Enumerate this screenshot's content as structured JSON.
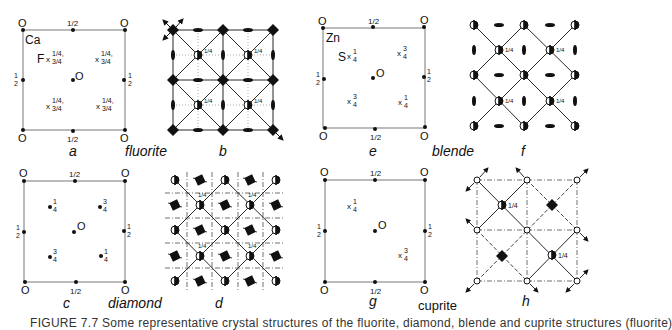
{
  "figure": {
    "caption": "FIGURE 7.7  Some representative crystal structures of the fluorite, diamond, blende and cuprite structures (fluorite)",
    "panels": [
      {
        "id": "a",
        "letter": "a",
        "structure": "fluorite",
        "atom1": "Ca",
        "atom2": "F",
        "corner_label": "O",
        "edge_mid_top": "1/2",
        "edge_mid_bottom": "1/2",
        "side_label": "1/2",
        "center_label": "O",
        "heights": [
          "1/4, 3/4",
          "1/4, 3/4",
          "1/4, 3/4",
          "1/4, 3/4"
        ]
      },
      {
        "id": "b",
        "letter": "b",
        "structure_name": "fluorite",
        "height_label": "1/4"
      },
      {
        "id": "e",
        "letter": "e",
        "structure": "blende",
        "atom1": "Zn",
        "atom2": "S",
        "corner_label": "O",
        "edge_mid_top": "1/2",
        "edge_mid_bottom": "1/2",
        "side_label": "1/2",
        "center_label": "O",
        "heights": [
          "1/4",
          "3/4",
          "3/4",
          "1/4"
        ]
      },
      {
        "id": "f",
        "letter": "f",
        "structure_name": "blende",
        "height_label": "1/4"
      },
      {
        "id": "c",
        "letter": "c",
        "structure": "diamond",
        "corner_label": "O",
        "edge_mid_top": "1/2",
        "edge_mid_bottom": "1/2",
        "side_label": "1/2",
        "center_label": "O",
        "heights": [
          "1/4",
          "3/4",
          "3/4",
          "1/4"
        ]
      },
      {
        "id": "d",
        "letter": "d",
        "structure_name": "diamond",
        "height_label": "1/4"
      },
      {
        "id": "g",
        "letter": "g",
        "structure": "cuprite",
        "corner_label": "O",
        "edge_mid_top": "1/2",
        "edge_mid_bottom": "1/2",
        "side_label": "1/2",
        "center_label": "O",
        "heights": [
          "1/4",
          "3/4"
        ]
      },
      {
        "id": "h",
        "letter": "h",
        "structure_name": "cuprite",
        "height_label": "1/4"
      }
    ],
    "structure_names": {
      "row1_left": "fluorite",
      "row1_right": "blende",
      "row2_left": "diamond",
      "row2_right": "cuprite"
    }
  }
}
